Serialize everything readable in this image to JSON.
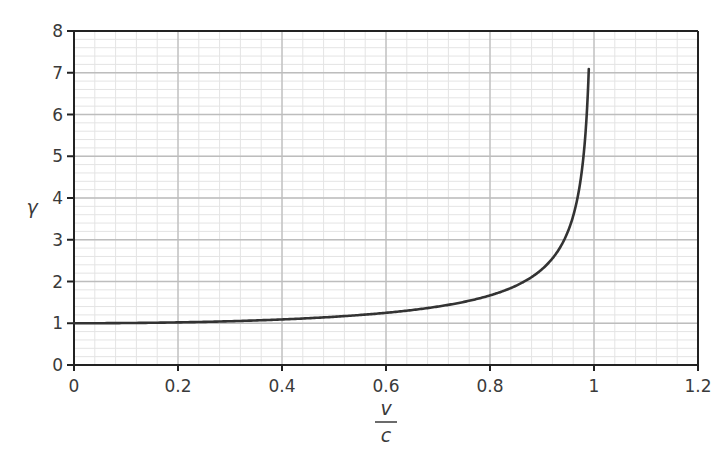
{
  "chart_data": {
    "type": "line",
    "title": "",
    "xlabel": "v/c",
    "xlabel_numerator": "v",
    "xlabel_denominator": "c",
    "ylabel": "γ",
    "xlim": [
      0,
      1.2
    ],
    "ylim": [
      0,
      8
    ],
    "x_ticks": [
      0,
      0.2,
      0.4,
      0.6,
      0.8,
      1,
      1.2
    ],
    "x_tick_labels": [
      "0",
      "0.2",
      "0.4",
      "0.6",
      "0.8",
      "1",
      "1.2"
    ],
    "y_ticks": [
      0,
      1,
      2,
      3,
      4,
      5,
      6,
      7,
      8
    ],
    "y_tick_labels": [
      "0",
      "1",
      "2",
      "3",
      "4",
      "5",
      "6",
      "7",
      "8"
    ],
    "x_minor_step": 0.04,
    "y_minor_step": 0.2,
    "grid": true,
    "legend": null,
    "series": [
      {
        "name": "Lorentz factor γ = 1/√(1 − v²/c²)",
        "color": "#333333",
        "x": [
          0,
          0.1,
          0.2,
          0.3,
          0.4,
          0.5,
          0.6,
          0.65,
          0.7,
          0.75,
          0.8,
          0.83,
          0.86,
          0.88,
          0.9,
          0.92,
          0.94,
          0.95,
          0.96,
          0.97,
          0.975,
          0.98,
          0.985,
          0.99
        ],
        "values": [
          1.0,
          1.005,
          1.021,
          1.048,
          1.091,
          1.155,
          1.25,
          1.316,
          1.4,
          1.512,
          1.667,
          1.792,
          1.96,
          2.105,
          2.294,
          2.552,
          2.931,
          3.203,
          3.571,
          4.113,
          4.5,
          5.025,
          5.795,
          7.089
        ]
      }
    ]
  },
  "colors": {
    "curve": "#333333",
    "axis": "#222222",
    "major_grid": "#bdbdbd",
    "minor_grid": "#e4e4e4",
    "text": "#3a3a3a"
  }
}
